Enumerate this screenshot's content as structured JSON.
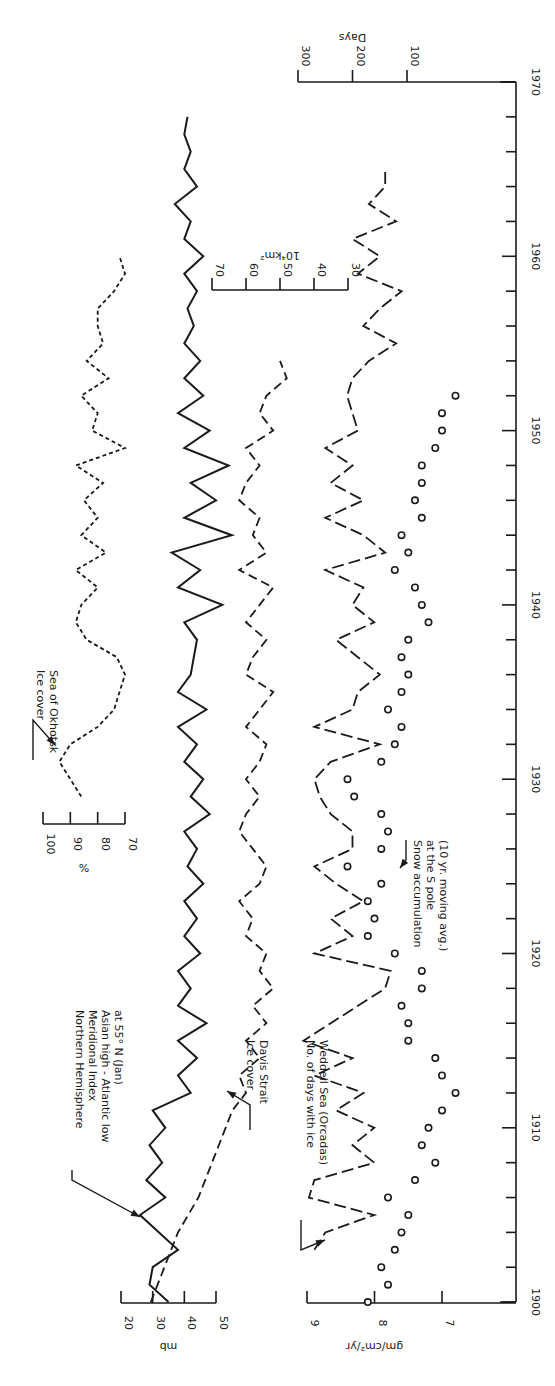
{
  "chart_data": {
    "type": "line",
    "orientation": "rotated-90 (time axis vertical, 1900 at bottom, 1970 at top; labels printed sideways)",
    "title": "",
    "time_axis": {
      "label": "Year",
      "range": [
        1900,
        1970
      ],
      "major_ticks": [
        1900,
        1910,
        1920,
        1930,
        1940,
        1950,
        1960,
        1970
      ],
      "minor_tick_step": 2
    },
    "value_axes": [
      {
        "id": "mb",
        "label": "mb",
        "ticks": [
          20,
          30,
          40,
          50
        ]
      },
      {
        "id": "pct",
        "label": "%",
        "ticks": [
          100,
          90,
          80,
          70
        ]
      },
      {
        "id": "km2",
        "label": "10⁴km²",
        "ticks": [
          70,
          60,
          50,
          40,
          30
        ]
      },
      {
        "id": "gm",
        "label": "gm/cm²/yr",
        "ticks": [
          9,
          8,
          7
        ]
      },
      {
        "id": "days",
        "label": "Days",
        "ticks": [
          300,
          200,
          100
        ]
      }
    ],
    "series": [
      {
        "name": "Northern Hemisphere Meridional Index Asian high - Atlantic low at 55° N (Jan)",
        "axis": "mb",
        "style": "solid",
        "x": [
          1900,
          1901,
          1902,
          1903,
          1904,
          1905,
          1906,
          1907,
          1908,
          1909,
          1910,
          1911,
          1912,
          1913,
          1914,
          1915,
          1916,
          1917,
          1918,
          1919,
          1920,
          1921,
          1922,
          1923,
          1924,
          1925,
          1926,
          1927,
          1928,
          1929,
          1930,
          1931,
          1932,
          1933,
          1934,
          1935,
          1936,
          1937,
          1938,
          1939,
          1940,
          1941,
          1942,
          1943,
          1944,
          1945,
          1946,
          1947,
          1948,
          1949,
          1950,
          1951,
          1952,
          1953,
          1954,
          1955,
          1956,
          1957,
          1958,
          1959,
          1960,
          1961,
          1962,
          1963,
          1964,
          1965,
          1966,
          1967,
          1968
        ],
        "values": [
          35,
          29,
          30,
          38,
          32,
          26,
          34,
          28,
          33,
          29,
          34,
          30,
          42,
          38,
          44,
          38,
          47,
          38,
          42,
          38,
          45,
          40,
          44,
          40,
          46,
          41,
          44,
          40,
          48,
          42,
          46,
          40,
          44,
          38,
          47,
          38,
          42,
          43,
          44,
          40,
          52,
          38,
          45,
          36,
          55,
          40,
          50,
          42,
          54,
          40,
          48,
          38,
          46,
          40,
          45,
          40,
          43,
          41,
          44,
          40,
          46,
          40,
          42,
          37,
          44,
          40,
          42,
          40,
          41
        ]
      },
      {
        "name": "Ice cover Sea of Okhotsk",
        "axis": "pct",
        "style": "dotted",
        "x": [
          1929,
          1930,
          1931,
          1932,
          1933,
          1934,
          1935,
          1936,
          1937,
          1938,
          1939,
          1940,
          1941,
          1942,
          1943,
          1944,
          1945,
          1946,
          1947,
          1948,
          1949,
          1950,
          1951,
          1952,
          1953,
          1954,
          1955,
          1956,
          1957,
          1958,
          1959,
          1960
        ],
        "values": [
          86,
          90,
          94,
          90,
          80,
          74,
          72,
          70,
          73,
          84,
          88,
          86,
          80,
          88,
          77,
          86,
          80,
          85,
          78,
          88,
          70,
          82,
          80,
          86,
          76,
          84,
          78,
          80,
          80,
          74,
          70,
          72
        ]
      },
      {
        "name": "Ice cover Davis Strait",
        "axis": "km2",
        "style": "dashed",
        "x": [
          1900,
          1902,
          1904,
          1906,
          1908,
          1910,
          1911,
          1912,
          1913,
          1914,
          1915,
          1916,
          1917,
          1918,
          1919,
          1920,
          1921,
          1922,
          1923,
          1924,
          1925,
          1926,
          1927,
          1928,
          1929,
          1930,
          1931,
          1932,
          1933,
          1934,
          1935,
          1936,
          1937,
          1938,
          1939,
          1940,
          1941,
          1942,
          1943,
          1944,
          1945,
          1946,
          1947,
          1948,
          1949,
          1950,
          1951,
          1952,
          1953,
          1954
        ],
        "values": [
          88,
          84,
          80,
          74,
          70,
          66,
          64,
          60,
          62,
          56,
          60,
          54,
          58,
          52,
          56,
          54,
          60,
          58,
          62,
          56,
          54,
          58,
          62,
          60,
          56,
          60,
          56,
          54,
          60,
          56,
          52,
          60,
          58,
          54,
          60,
          56,
          52,
          62,
          54,
          58,
          56,
          62,
          60,
          56,
          60,
          52,
          56,
          54,
          48,
          50
        ]
      },
      {
        "name": "No. of days with ice Weddell Sea (Orcadas)",
        "axis": "days",
        "style": "longdash",
        "x": [
          1903,
          1904,
          1905,
          1906,
          1907,
          1908,
          1909,
          1910,
          1911,
          1912,
          1913,
          1914,
          1915,
          1916,
          1917,
          1918,
          1919,
          1920,
          1921,
          1922,
          1923,
          1924,
          1925,
          1926,
          1927,
          1928,
          1929,
          1930,
          1931,
          1932,
          1933,
          1934,
          1935,
          1936,
          1937,
          1938,
          1939,
          1940,
          1941,
          1942,
          1943,
          1944,
          1945,
          1946,
          1947,
          1948,
          1949,
          1950,
          1951,
          1952,
          1953,
          1954,
          1955,
          1956,
          1957,
          1958,
          1959,
          1960,
          1961,
          1962,
          1963,
          1964,
          1965
        ],
        "values": [
          270,
          250,
          160,
          280,
          270,
          160,
          200,
          160,
          230,
          180,
          270,
          200,
          290,
          240,
          190,
          140,
          130,
          270,
          200,
          240,
          180,
          230,
          270,
          200,
          200,
          240,
          260,
          270,
          240,
          150,
          270,
          200,
          190,
          150,
          190,
          230,
          160,
          200,
          180,
          250,
          140,
          180,
          250,
          180,
          240,
          200,
          250,
          190,
          200,
          210,
          200,
          170,
          120,
          180,
          150,
          110,
          190,
          150,
          200,
          120,
          170,
          140,
          140
        ]
      },
      {
        "name": "Snow accumulation at the S pole (10 yr. moving avg.)",
        "axis": "gm",
        "style": "circles",
        "x": [
          1900,
          1901,
          1902,
          1903,
          1904,
          1905,
          1906,
          1907,
          1908,
          1909,
          1910,
          1911,
          1912,
          1913,
          1914,
          1915,
          1916,
          1917,
          1918,
          1919,
          1920,
          1921,
          1922,
          1923,
          1924,
          1925,
          1926,
          1927,
          1928,
          1929,
          1930,
          1931,
          1932,
          1933,
          1934,
          1935,
          1936,
          1937,
          1938,
          1939,
          1940,
          1941,
          1942,
          1943,
          1944,
          1945,
          1946,
          1947,
          1948,
          1949,
          1950,
          1951,
          1952
        ],
        "values": [
          8.1,
          7.8,
          7.9,
          7.7,
          7.6,
          7.5,
          7.8,
          7.4,
          7.1,
          7.3,
          7.2,
          7.0,
          6.8,
          7.0,
          7.1,
          7.5,
          7.5,
          7.6,
          7.3,
          7.3,
          7.7,
          8.1,
          8.0,
          8.1,
          7.9,
          8.4,
          7.9,
          7.8,
          7.9,
          8.3,
          8.4,
          7.9,
          7.7,
          7.6,
          7.8,
          7.6,
          7.5,
          7.6,
          7.5,
          7.2,
          7.3,
          7.4,
          7.7,
          7.5,
          7.6,
          7.3,
          7.4,
          7.3,
          7.3,
          7.1,
          7.0,
          7.0,
          6.8
        ]
      }
    ],
    "annotations": [
      {
        "text": [
          "Northern Hemisphere",
          "Meridional Index",
          "Asian high - Atlantic low",
          "at 55° N (Jan)"
        ]
      },
      {
        "text": [
          "Ice cover",
          "Sea of Okhotsk"
        ]
      },
      {
        "text": [
          "Ice cover",
          "Davis Strait"
        ]
      },
      {
        "text": [
          "No. of days with ice",
          "Weddell Sea (Orcadas)"
        ]
      },
      {
        "text": [
          "Snow accumulation",
          "at the S pole",
          "(10 yr. moving avg.)"
        ]
      }
    ],
    "grid": false,
    "legend_position": "inline labels with leader arrows"
  }
}
